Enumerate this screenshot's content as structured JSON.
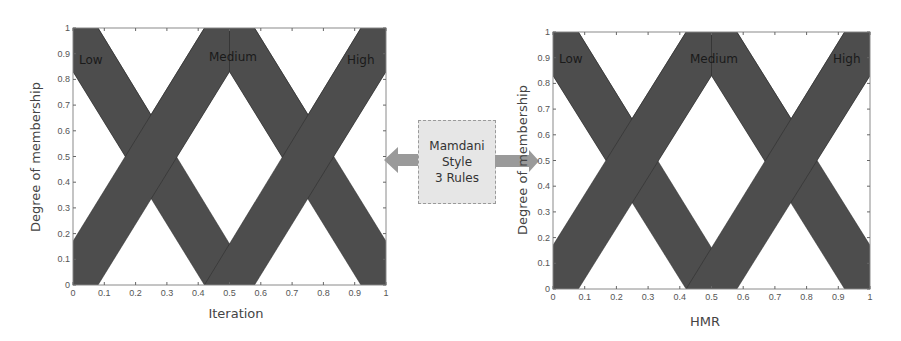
{
  "chart_data": [
    {
      "type": "area",
      "title": "",
      "xlabel": "Iteration",
      "ylabel": "Degree of membership",
      "xlim": [
        0,
        1
      ],
      "ylim": [
        0,
        1
      ],
      "xticks": [
        "0",
        "0.1",
        "0.2",
        "0.3",
        "0.4",
        "0.5",
        "0.6",
        "0.7",
        "0.8",
        "0.9",
        "1"
      ],
      "yticks": [
        "0",
        "0.1",
        "0.2",
        "0.3",
        "0.4",
        "0.5",
        "0.6",
        "0.7",
        "0.8",
        "0.9",
        "1"
      ],
      "grid": false,
      "fill_color": "#4d4d4d",
      "series": [
        {
          "name": "Low",
          "upper_mf": [
            [
              0,
              1
            ],
            [
              0.08,
              1
            ],
            [
              0.58,
              0
            ]
          ],
          "lower_mf": [
            [
              0,
              0.83
            ],
            [
              0.42,
              0
            ]
          ]
        },
        {
          "name": "Medium",
          "upper_mf": [
            [
              0,
              0.17
            ],
            [
              0.42,
              1
            ],
            [
              0.58,
              1
            ],
            [
              1,
              0.17
            ]
          ],
          "lower_mf": [
            [
              0.08,
              0
            ],
            [
              0.5,
              0.83
            ],
            [
              0.92,
              0
            ]
          ]
        },
        {
          "name": "High",
          "upper_mf": [
            [
              0.42,
              0
            ],
            [
              0.92,
              1
            ],
            [
              1,
              1
            ]
          ],
          "lower_mf": [
            [
              0.58,
              0
            ],
            [
              1,
              0.83
            ]
          ]
        }
      ]
    },
    {
      "type": "area",
      "title": "",
      "xlabel": "HMR",
      "ylabel": "Degree of membership",
      "xlim": [
        0,
        1
      ],
      "ylim": [
        0,
        1
      ],
      "xticks": [
        "0",
        "0.1",
        "0.2",
        "0.3",
        "0.4",
        "0.5",
        "0.6",
        "0.7",
        "0.8",
        "0.9",
        "1"
      ],
      "yticks": [
        "0",
        "0.1",
        "0.2",
        "0.3",
        "0.4",
        "0.5",
        "0.6",
        "0.7",
        "0.8",
        "0.9",
        "1"
      ],
      "grid": false,
      "fill_color": "#4d4d4d",
      "series": [
        {
          "name": "Low",
          "upper_mf": [
            [
              0,
              1
            ],
            [
              0.08,
              1
            ],
            [
              0.58,
              0
            ]
          ],
          "lower_mf": [
            [
              0,
              0.83
            ],
            [
              0.42,
              0
            ]
          ]
        },
        {
          "name": "Medium",
          "upper_mf": [
            [
              0,
              0.17
            ],
            [
              0.42,
              1
            ],
            [
              0.58,
              1
            ],
            [
              1,
              0.17
            ]
          ],
          "lower_mf": [
            [
              0.08,
              0
            ],
            [
              0.5,
              0.83
            ],
            [
              0.92,
              0
            ]
          ]
        },
        {
          "name": "High",
          "upper_mf": [
            [
              0.42,
              0
            ],
            [
              0.92,
              1
            ],
            [
              1,
              1
            ]
          ],
          "lower_mf": [
            [
              0.58,
              0
            ],
            [
              1,
              0.83
            ]
          ]
        }
      ]
    }
  ],
  "left_chart": {
    "xlabel": "Iteration",
    "ylabel": "Degree of membership",
    "labels": {
      "low": "Low",
      "medium": "Medium",
      "high": "High"
    }
  },
  "right_chart": {
    "xlabel": "HMR",
    "ylabel": "Degree of membership",
    "labels": {
      "low": "Low",
      "medium": "Medium",
      "high": "High"
    }
  },
  "center_box": {
    "line1": "Mamdani",
    "line2": "Style",
    "line3": "3 Rules"
  },
  "ticks": [
    "0",
    "0.1",
    "0.2",
    "0.3",
    "0.4",
    "0.5",
    "0.6",
    "0.7",
    "0.8",
    "0.9",
    "1"
  ],
  "colors": {
    "band": "#4d4d4d",
    "arrow": "#9a9a9a",
    "box": "#e6e6e6"
  }
}
